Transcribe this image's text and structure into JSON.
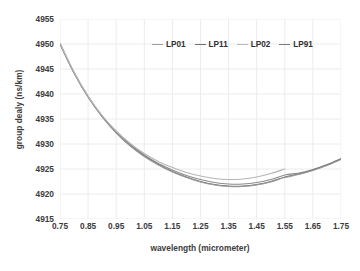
{
  "chart_data": {
    "type": "line",
    "title": "",
    "xlabel": "wavelength (micrometer)",
    "ylabel": "group dealy (ns/km)",
    "xlim": [
      0.75,
      1.75
    ],
    "ylim": [
      4915,
      4955
    ],
    "xticks": [
      "0.75",
      "0.85",
      "0.95",
      "1.05",
      "1.15",
      "1.25",
      "1.35",
      "1.45",
      "1.55",
      "1.65",
      "1.75"
    ],
    "yticks": [
      "4915",
      "4920",
      "4925",
      "4930",
      "4935",
      "4940",
      "4945",
      "4950",
      "4955"
    ],
    "grid": true,
    "legend_position": "top-center",
    "x": [
      0.75,
      0.8,
      0.85,
      0.9,
      0.95,
      1.0,
      1.05,
      1.1,
      1.15,
      1.2,
      1.25,
      1.3,
      1.35,
      1.4,
      1.45,
      1.5,
      1.55,
      1.6,
      1.65,
      1.7,
      1.75
    ],
    "series": [
      {
        "name": "LP01",
        "color": "#8c8c8c",
        "values": [
          4950.1,
          4944.3,
          4939.5,
          4935.6,
          4932.4,
          4929.9,
          4927.8,
          4926.1,
          4924.8,
          4923.7,
          4922.9,
          4922.3,
          4922.0,
          4922.0,
          4922.3,
          4922.9,
          4923.8,
          4924.2,
          4924.9,
          4925.9,
          4927.1
        ]
      },
      {
        "name": "LP11",
        "color": "#6f6f6f",
        "values": [
          4950.0,
          4944.2,
          4939.4,
          4935.5,
          4932.3,
          4929.7,
          4927.6,
          4925.9,
          4924.5,
          4923.4,
          4922.5,
          4921.9,
          4921.6,
          4921.6,
          4921.9,
          4922.5,
          4923.4,
          4924.0,
          4924.8,
          4925.8,
          4927.0
        ]
      },
      {
        "name": "LP02",
        "color": "#9a9a9a",
        "values": [
          4950.0,
          4944.2,
          4939.4,
          4935.4,
          4932.2,
          4929.6,
          4927.5,
          4925.8,
          4924.4,
          4923.3,
          4922.4,
          4921.8,
          4921.5,
          4921.5,
          4921.8,
          4922.4,
          4923.3,
          4923.9,
          4924.7,
          4925.7,
          4926.9
        ]
      },
      {
        "name": "LP91",
        "color": "#b5b5b5",
        "values": [
          4950.2,
          4944.4,
          4939.6,
          4935.7,
          4932.6,
          4930.1,
          4928.1,
          4926.5,
          4925.3,
          4924.3,
          4923.6,
          4923.1,
          4922.9,
          4923.0,
          4923.4,
          4924.1,
          4925.0,
          null,
          null,
          null,
          null
        ]
      }
    ],
    "legend": [
      {
        "label": "LP01",
        "color": "#9d9d9d"
      },
      {
        "label": "LP11",
        "color": "#6f6f6f"
      },
      {
        "label": "LP02",
        "color": "#b8b8b8"
      },
      {
        "label": "LP91",
        "color": "#7d7d7d"
      }
    ]
  },
  "style": {
    "grid_color": "#ececec",
    "text_color": "#3c3c3c",
    "background": "#ffffff"
  }
}
